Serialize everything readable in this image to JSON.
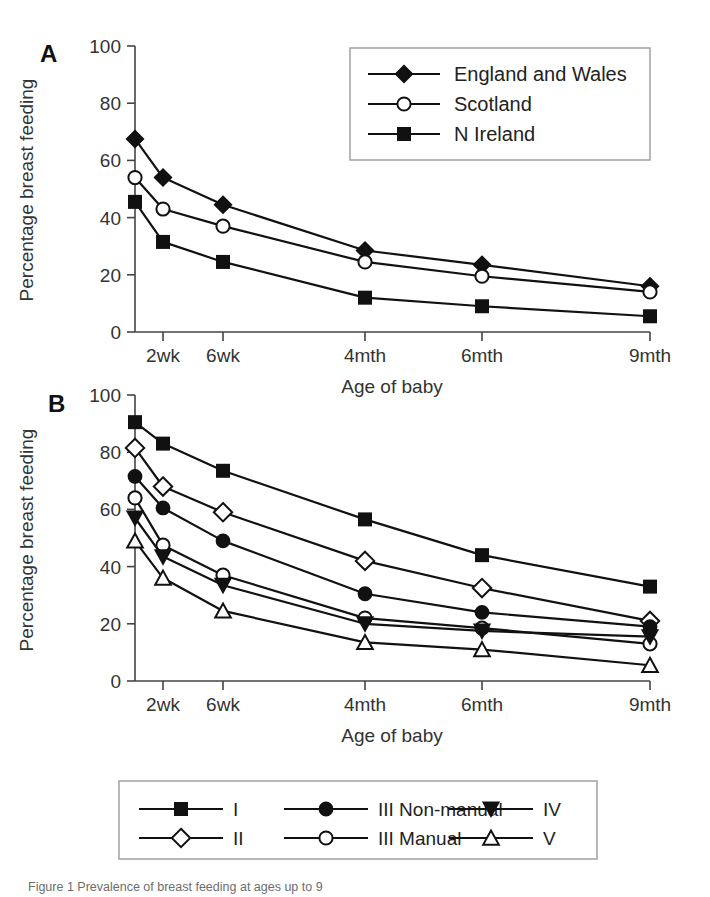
{
  "figure": {
    "background": "#ffffff",
    "ink_color": "#111111",
    "panels": [
      "A",
      "B"
    ]
  },
  "chart_data": [
    {
      "type": "line",
      "panel": "A",
      "title": "",
      "xlabel": "Age of baby",
      "ylabel": "Percentage breast feeding",
      "categories": [
        "2wk",
        "6wk",
        "4mth",
        "6mth",
        "9mth"
      ],
      "x_positions": [
        163,
        223,
        365,
        482,
        650
      ],
      "xlim_px": [
        135,
        650
      ],
      "ylim": [
        0,
        100
      ],
      "yticks": [
        0,
        20,
        40,
        60,
        80,
        100
      ],
      "ytick_labels": [
        "0",
        "20",
        "40",
        "60",
        "80",
        "100"
      ],
      "grid": false,
      "legend_position": "top-right",
      "series": [
        {
          "name": "England and Wales",
          "marker": "diamond-filled",
          "values_start": 67.5,
          "values": [
            54,
            44.5,
            28.5,
            23.5,
            16
          ]
        },
        {
          "name": "Scotland",
          "marker": "circle-open",
          "values_start": 54,
          "values": [
            43,
            37,
            24.5,
            19.5,
            14
          ]
        },
        {
          "name": "N Ireland",
          "marker": "square-filled",
          "values_start": 45.5,
          "values": [
            31.5,
            24.5,
            12,
            9,
            5.5
          ]
        }
      ]
    },
    {
      "type": "line",
      "panel": "B",
      "title": "",
      "xlabel": "Age of baby",
      "ylabel": "Percentage breast feeding",
      "categories": [
        "2wk",
        "6wk",
        "4mth",
        "6mth",
        "9mth"
      ],
      "x_positions": [
        163,
        223,
        365,
        482,
        650
      ],
      "xlim_px": [
        135,
        650
      ],
      "ylim": [
        0,
        100
      ],
      "yticks": [
        0,
        20,
        40,
        60,
        80,
        100
      ],
      "ytick_labels": [
        "0",
        "20",
        "40",
        "60",
        "80",
        "100"
      ],
      "grid": false,
      "legend_position": "below",
      "series": [
        {
          "name": "I",
          "marker": "square-filled",
          "values_start": 90.5,
          "values": [
            83,
            73.5,
            56.5,
            44,
            33
          ]
        },
        {
          "name": "II",
          "marker": "diamond-open",
          "values_start": 81.5,
          "values": [
            68,
            59,
            42,
            32.5,
            21
          ]
        },
        {
          "name": "III Non-manual",
          "marker": "circle-filled",
          "values_start": 71.5,
          "values": [
            60.5,
            49,
            30.5,
            24,
            19
          ]
        },
        {
          "name": "III Manual",
          "marker": "circle-open",
          "values_start": 64,
          "values": [
            47.5,
            37,
            22,
            18.5,
            13
          ]
        },
        {
          "name": "IV",
          "marker": "triangle-down-filled",
          "values_start": 57,
          "values": [
            43.5,
            33.5,
            20,
            17.5,
            15.5
          ]
        },
        {
          "name": "V",
          "marker": "triangle-up-open",
          "values_start": 49,
          "values": [
            36,
            24.5,
            13.5,
            11,
            5.5
          ]
        }
      ]
    }
  ],
  "panel_a": {
    "letter": "A",
    "ylabel": "Percentage breast feeding",
    "xlabel": "Age of baby",
    "ytick_labels": [
      "100",
      "80",
      "60",
      "40",
      "20",
      "0"
    ],
    "xtick_labels": [
      "2wk",
      "6wk",
      "4mth",
      "6mth",
      "9mth"
    ],
    "legend": {
      "items": [
        {
          "label": "England and Wales",
          "marker": "diamond-filled"
        },
        {
          "label": "Scotland",
          "marker": "circle-open"
        },
        {
          "label": "N Ireland",
          "marker": "square-filled"
        }
      ]
    }
  },
  "panel_b": {
    "letter": "B",
    "ylabel": "Percentage breast feeding",
    "xlabel": "Age of baby",
    "ytick_labels": [
      "100",
      "80",
      "60",
      "40",
      "20",
      "0"
    ],
    "xtick_labels": [
      "2wk",
      "6wk",
      "4mth",
      "6mth",
      "9mth"
    ],
    "legend": {
      "items": [
        {
          "label": "I",
          "marker": "square-filled"
        },
        {
          "label": "II",
          "marker": "diamond-open"
        },
        {
          "label": "III Non-manual",
          "marker": "circle-filled"
        },
        {
          "label": "III Manual",
          "marker": "circle-open"
        },
        {
          "label": "IV",
          "marker": "triangle-down-filled"
        },
        {
          "label": "V",
          "marker": "triangle-up-open"
        }
      ]
    }
  },
  "caption": {
    "text": "Figure 1    Prevalence of breast feeding at ages up to 9"
  }
}
